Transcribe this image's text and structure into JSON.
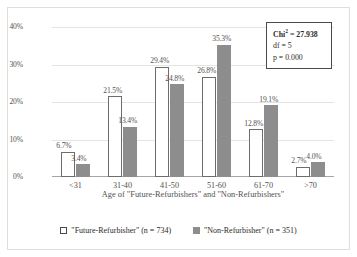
{
  "chart_data": {
    "type": "bar",
    "title": "",
    "subtitle": "",
    "xlabel": "Age of \"Future-Refurbishers\" and \"Non-Refurbishers\"",
    "ylabel": "Relative frequency (%)",
    "categories": [
      "<31",
      "31-40",
      "41-50",
      "51-60",
      "61-70",
      ">70"
    ],
    "ylim": [
      0,
      40
    ],
    "yticks": [
      "0%",
      "10%",
      "20%",
      "30%",
      "40%"
    ],
    "ytick_values": [
      0,
      10,
      20,
      30,
      40
    ],
    "grid": "horizontal",
    "legend_position": "bottom",
    "series": [
      {
        "name": "\"Future-Refurbisher\" (n = 734)",
        "style": "hollow",
        "color": "#ffffff",
        "edge_color": "#6d6d6d",
        "values": [
          6.7,
          21.5,
          29.4,
          26.8,
          12.8,
          2.7
        ],
        "labels": [
          "6.7%",
          "21.5%",
          "29.4%",
          "26.8%",
          "12.8%",
          "2.7%"
        ]
      },
      {
        "name": "\"Non-Refurbisher\" (n = 351)",
        "style": "solid",
        "color": "#8d8d8d",
        "edge_color": "#8d8d8d",
        "values": [
          3.4,
          13.4,
          24.8,
          35.3,
          19.1,
          4.0
        ],
        "labels": [
          "3.4%",
          "13.4%",
          "24.8%",
          "35.3%",
          "19.1%",
          "4.0%"
        ]
      }
    ],
    "annotations": {
      "chi_square": "Chi² = 27.938",
      "chi_label": "Chi",
      "chi_superscript": "2",
      "chi_value": " = 27.938",
      "df": "df = 5",
      "p_value": "p = 0.000"
    }
  },
  "colors": {
    "series_1_fill": "#ffffff",
    "series_1_edge": "#6d6d6d",
    "series_2_fill": "#8d8d8d",
    "gridline": "#e4e4e0",
    "axis": "#a6a6a6",
    "text": "#55524f",
    "box_border": "#4a4a4a",
    "frame": "#dededa"
  }
}
